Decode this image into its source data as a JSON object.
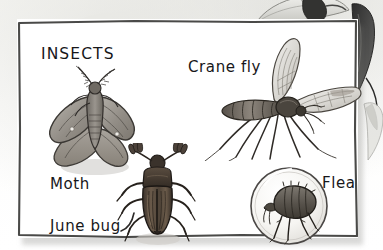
{
  "illustration": {
    "kind": "book-illustration-panel",
    "subject": "insects",
    "panel_title": "INSECTS",
    "background_color": "#fdfdfb",
    "panel_color": "#ffffff",
    "ink_color": "#17171a",
    "labels": [
      {
        "id": "insects",
        "text": "INSECTS",
        "role": "panel-title"
      },
      {
        "id": "crane-fly",
        "text": "Crane fly",
        "role": "specimen-label"
      },
      {
        "id": "moth",
        "text": "Moth",
        "role": "specimen-label"
      },
      {
        "id": "june-bug",
        "text": "June bug",
        "role": "specimen-label"
      },
      {
        "id": "flea",
        "text": "Flea",
        "role": "specimen-label"
      }
    ],
    "specimens": [
      {
        "id": "moth",
        "name": "Moth",
        "drawing": "grey-brown moth with spread wings and feathery antennae"
      },
      {
        "id": "june-bug",
        "name": "June bug",
        "drawing": "dark brown beetle, ribbed elytra, fanned antennae, six legs"
      },
      {
        "id": "crane-fly",
        "name": "Crane fly",
        "drawing": "long-legged fly with two translucent wings and segmented abdomen"
      },
      {
        "id": "flea",
        "name": "Flea",
        "drawing": "flea shown magnified inside a circular lens"
      }
    ],
    "surrounding_art": {
      "description": "partial bird illustrations overlapping the panel from above and the right edge",
      "elements": [
        {
          "id": "bird-claw-top",
          "description": "dark bird foot gripping the top edge of the panel"
        },
        {
          "id": "bird-body-top",
          "description": "pale bird body and tail above the panel"
        },
        {
          "id": "bird-right",
          "description": "dark bird silhouette along the right edge"
        }
      ]
    }
  }
}
